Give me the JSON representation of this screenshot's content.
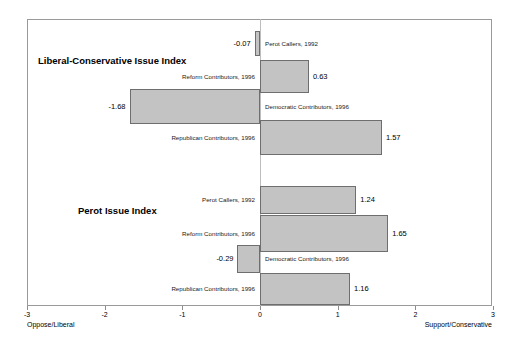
{
  "chart_data": {
    "type": "bar",
    "orientation": "horizontal",
    "title": "",
    "xlabel": "",
    "ylabel": "",
    "xlim": [
      -3,
      3
    ],
    "xticks": [
      -3,
      -2,
      -1,
      0,
      1,
      2,
      3
    ],
    "xtick_labels": [
      "-3",
      "-2",
      "-1",
      "0",
      "1",
      "2",
      "3"
    ],
    "grid": false,
    "legend": "none",
    "axis_end_labels": {
      "left": "Oppose/Liberal",
      "right": "Support/Conservative"
    },
    "groups": [
      {
        "title": "Liberal-Conservative Issue Index",
        "categories": [
          "Perot Callers, 1992",
          "Reform Contributors, 1996",
          "Democratic Contributors, 1996",
          "Republican Contributors, 1996"
        ],
        "values": [
          -0.07,
          0.63,
          -1.68,
          1.57
        ],
        "value_labels": [
          "-0.07",
          "0.63",
          "-1.68",
          "1.57"
        ]
      },
      {
        "title": "Perot Issue Index",
        "categories": [
          "Perot Callers, 1992",
          "Reform Contributors, 1996",
          "Democratic Contributors, 1996",
          "Republican Contributors, 1996"
        ],
        "values": [
          1.24,
          1.65,
          -0.29,
          1.16
        ],
        "value_labels": [
          "1.24",
          "1.65",
          "-0.29",
          "1.16"
        ]
      }
    ],
    "colors": {
      "bar_fill": "#c3c3c3",
      "bar_border": "#6e6e6e",
      "frame": "#9a9a9a",
      "zero_line": "#bdbdbd",
      "text": "#000000"
    }
  }
}
